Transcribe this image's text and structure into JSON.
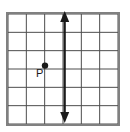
{
  "figure": {
    "type": "coordinate-grid-diagram",
    "background_color": "#ffffff",
    "grid": {
      "columns": 6,
      "rows": 6,
      "left": 8,
      "top": 14,
      "right": 118,
      "bottom": 124,
      "cell_size": 18.33,
      "inner_line_color": "#4d4d4d",
      "border_color": "#808080",
      "inner_line_width": 1,
      "border_width": 2
    },
    "points": [
      {
        "label": "P",
        "label_name": "point-p-label",
        "dot_name": "point-p-dot",
        "x_px": 45.0,
        "y_px": 65.6,
        "grid_col": 2,
        "grid_row": 3,
        "dot_radius": 3.2,
        "dot_color": "#1a1a1a",
        "label_color": "#1a1a1a",
        "label_x_px": 36,
        "label_y_px": 68
      }
    ],
    "lines": [
      {
        "name": "vertical-double-arrow-line",
        "orientation": "vertical",
        "x_px": 64.7,
        "y_start_px": 11,
        "y_end_px": 123,
        "color": "#1a1a1a",
        "stroke_width": 2.2,
        "arrow_start": true,
        "arrow_end": true,
        "arrow_head_width": 9,
        "arrow_head_length": 11,
        "grid_col": 3
      }
    ]
  }
}
